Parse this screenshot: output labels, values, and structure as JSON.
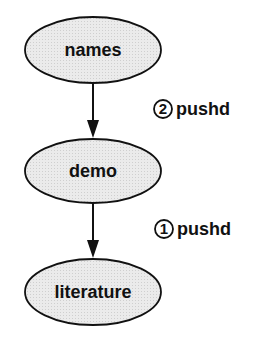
{
  "diagram": {
    "colors": {
      "node_fill": "#e8e8e8",
      "stroke": "#111111",
      "background": "#ffffff"
    },
    "nodes": [
      {
        "id": "names",
        "label": "names"
      },
      {
        "id": "demo",
        "label": "demo"
      },
      {
        "id": "literature",
        "label": "literature"
      }
    ],
    "edges": [
      {
        "from": "names",
        "to": "demo",
        "step": "2",
        "label": "pushd"
      },
      {
        "from": "demo",
        "to": "literature",
        "step": "1",
        "label": "pushd"
      }
    ]
  }
}
